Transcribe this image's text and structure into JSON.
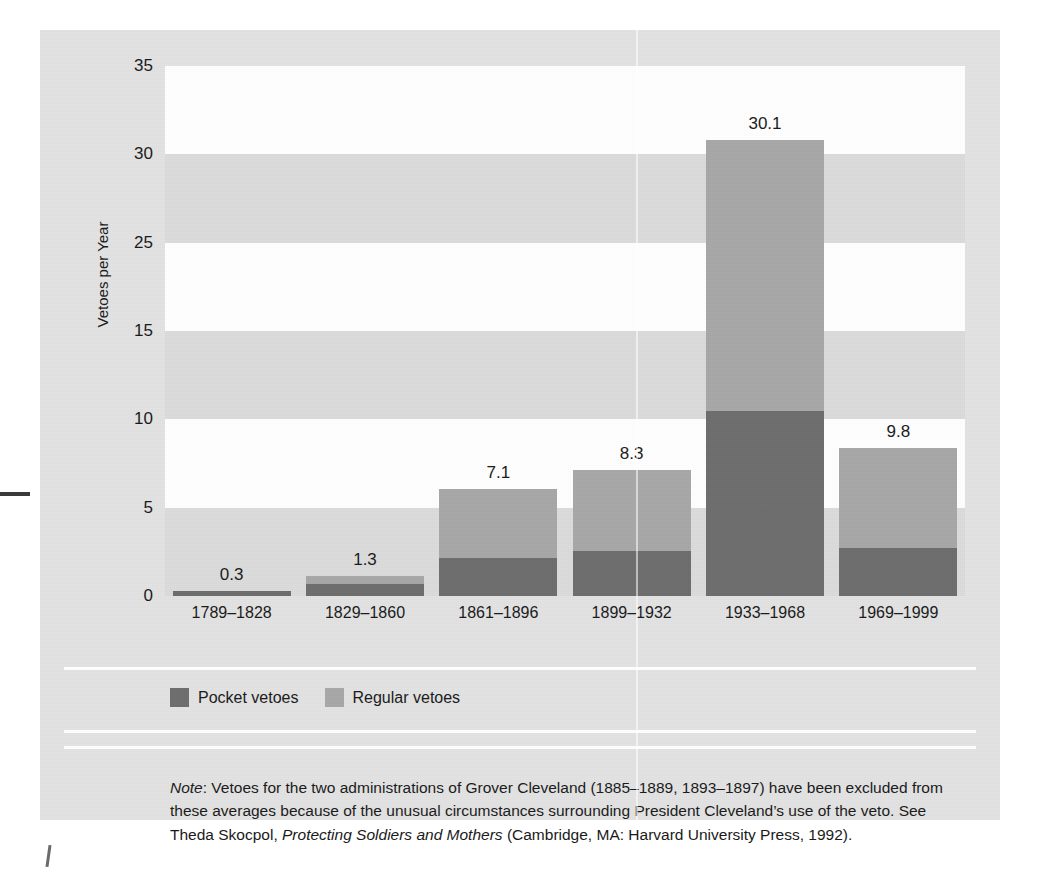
{
  "colors": {
    "page_background": "#ffffff",
    "card_background": "#e3e3e3",
    "band_light": "#ffffff",
    "band_gray": "#dcdcdc",
    "pocket": "#6e6e6e",
    "regular": "#a8a8a8",
    "rule": "#ffffff",
    "text": "#1a1a1a"
  },
  "chart_data": {
    "type": "bar",
    "subtype": "stacked",
    "title": "",
    "xlabel": "",
    "ylabel": "Vetoes per Year",
    "ylim": [
      0,
      35
    ],
    "grid": "horizontal-bands",
    "legend_position": "below-plot",
    "ytick_labels": [
      "35",
      "30",
      "25",
      "15",
      "10",
      "5",
      "0"
    ],
    "ytick_values": [
      35,
      30,
      25,
      20,
      15,
      10,
      5
    ],
    "categories": [
      "1789–1828",
      "1829–1860",
      "1861–1896",
      "1899–1932",
      "1933–1968",
      "1969–1999"
    ],
    "series": [
      {
        "name": "Pocket vetoes",
        "color": "#6e6e6e",
        "values": [
          0.3,
          0.8,
          2.5,
          3.0,
          12.2,
          3.2
        ]
      },
      {
        "name": "Regular vetoes",
        "color": "#a8a8a8",
        "values": [
          0.0,
          0.5,
          4.6,
          5.3,
          17.9,
          6.6
        ]
      }
    ],
    "totals": [
      0.3,
      1.3,
      7.1,
      8.3,
      30.1,
      9.8
    ],
    "total_labels": [
      "0.3",
      "1.3",
      "7.1",
      "8.3",
      "30.1",
      "9.8"
    ]
  },
  "legend": {
    "items": [
      {
        "label": "Pocket vetoes",
        "color": "#6e6e6e"
      },
      {
        "label": "Regular vetoes",
        "color": "#a8a8a8"
      }
    ]
  },
  "note": {
    "lead": "Note",
    "body": ": Vetoes for the two administrations of Grover Cleveland (1885–1889, 1893–1897) have been excluded from these averages because of the unusual circumstances surrounding President Cleveland’s use of the veto. See Theda Skocpol, ",
    "title": "Protecting Soldiers and Mothers",
    "tail": " (Cambridge, MA: Harvard University Press, 1992)."
  }
}
